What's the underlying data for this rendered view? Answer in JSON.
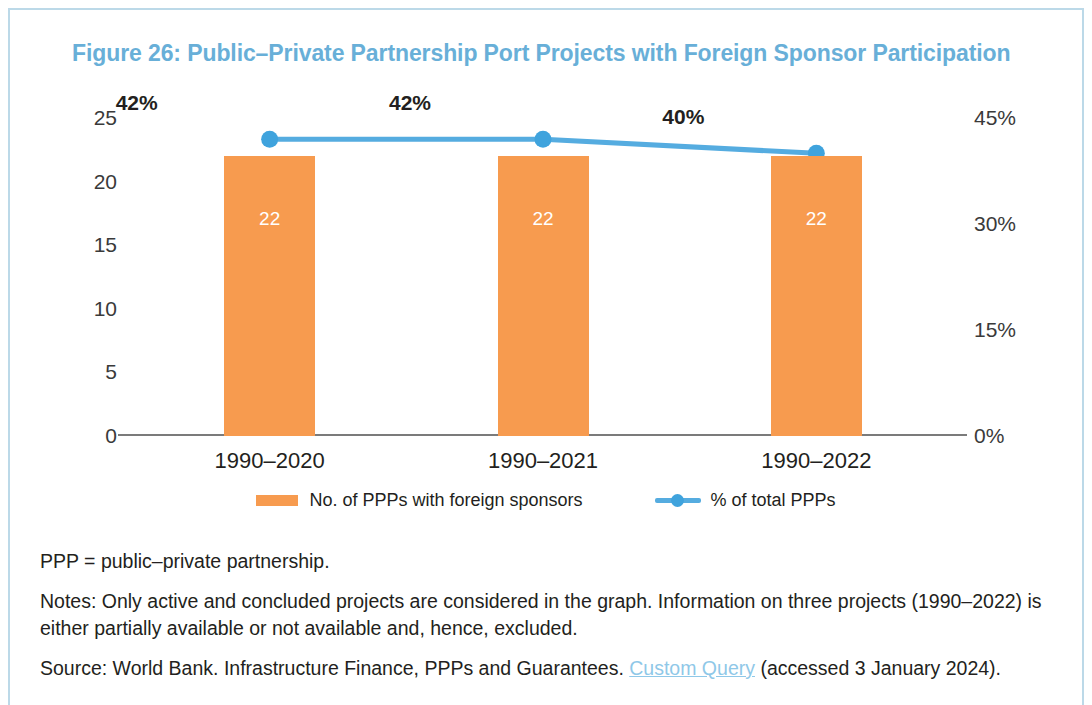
{
  "figure": {
    "title": "Figure 26: Public–Private Partnership Port Projects with Foreign Sponsor Participation",
    "title_color": "#68afd8",
    "frame_color": "#bcd9e8"
  },
  "chart_data": {
    "type": "bar",
    "title": "Figure 26: Public–Private Partnership Port Projects with Foreign Sponsor Participation",
    "xlabel": "",
    "ylabel": "",
    "categories": [
      "1990–2020",
      "1990–2021",
      "1990–2022"
    ],
    "series": [
      {
        "name": "No. of PPPs with foreign sponsors",
        "type": "bar",
        "axis": "left",
        "color": "#f79b4f",
        "values": [
          22,
          22,
          22
        ],
        "data_labels": [
          "22",
          "22",
          "22"
        ]
      },
      {
        "name": "% of total PPPs",
        "type": "line",
        "axis": "right",
        "color": "#55ace0",
        "values": [
          42,
          42,
          40
        ],
        "data_labels": [
          "42%",
          "42%",
          "40%"
        ]
      }
    ],
    "left_axis": {
      "ticks": [
        0,
        5,
        10,
        15,
        20,
        25
      ],
      "tick_labels": [
        "0",
        "5",
        "10",
        "15",
        "20",
        "25"
      ],
      "ylim": [
        0,
        25
      ]
    },
    "right_axis": {
      "ticks": [
        0,
        15,
        30,
        45
      ],
      "tick_labels": [
        "0%",
        "15%",
        "30%",
        "45%"
      ],
      "ylim": [
        0,
        45
      ]
    },
    "grid": false,
    "legend_position": "bottom"
  },
  "legend": {
    "items": [
      {
        "label": "No. of PPPs with foreign sponsors",
        "marker": "bar-swatch",
        "color": "#f79b4f"
      },
      {
        "label": "% of total PPPs",
        "marker": "line-marker",
        "color": "#55ace0"
      }
    ]
  },
  "notes": {
    "abbreviation": "PPP = public–private partnership.",
    "note": "Notes: Only active and concluded projects are considered in the graph. Information on three projects (1990–2022) is either partially available or not available and, hence, excluded.",
    "source_prefix": "Source: World Bank. Infrastructure Finance, PPPs and Guarantees. ",
    "source_link": "Custom Query",
    "source_suffix": " (accessed 3 January 2024)."
  }
}
